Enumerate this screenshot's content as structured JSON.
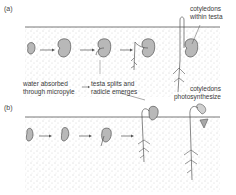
{
  "figure": {
    "parts": [
      {
        "id": "a",
        "label": "(a)"
      },
      {
        "id": "b",
        "label": "(b)"
      }
    ],
    "labels": {
      "water_line1": "water absorbed",
      "water_line2": "through micropyle",
      "testa_line1": "testa splits and",
      "testa_line2": "radicle emerges",
      "cot_within_line1": "cotyledons",
      "cot_within_line2": "within testa",
      "cot_photo_line1": "cotyledons",
      "cot_photo_line2": "photosynthesize"
    },
    "colors": {
      "soil_dots": "#9a9a9a",
      "seed_fill": "#b8b8b8",
      "outline": "#555555",
      "text": "#3a3a3a"
    }
  }
}
